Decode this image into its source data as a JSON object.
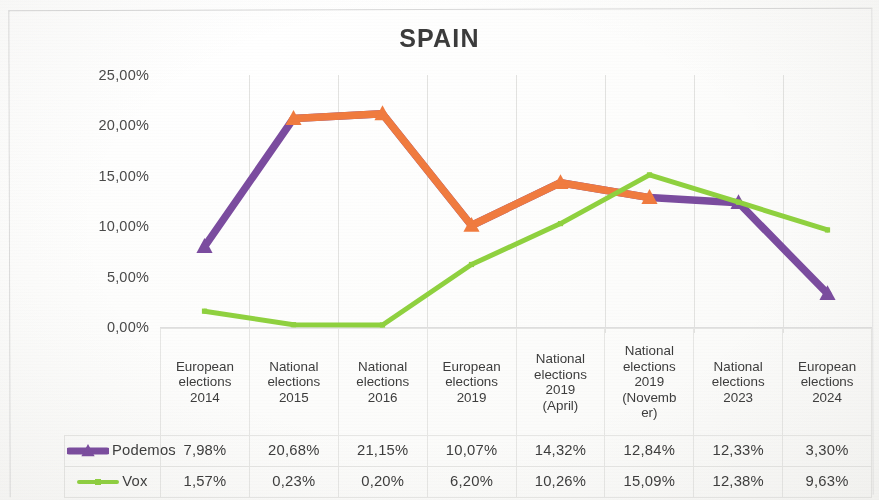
{
  "chart_data": {
    "type": "line",
    "title": "SPAIN",
    "xlabel": "",
    "ylabel": "",
    "ylim": [
      0,
      25
    ],
    "ytick_values": [
      0,
      5,
      10,
      15,
      20,
      25
    ],
    "ytick_labels": [
      "0,00%",
      "5,00%",
      "10,00%",
      "15,00%",
      "20,00%",
      "25,00%"
    ],
    "grid": "vertical",
    "legend_position": "table-left",
    "categories": [
      "European elections 2014",
      "National elections 2015",
      "National elections 2016",
      "European elections 2019",
      "National elections 2019 (April)",
      "National elections 2019 (Novemb er)",
      "National elections 2023",
      "European elections 2024"
    ],
    "category_lines": [
      [
        "European",
        "elections",
        "2014"
      ],
      [
        "National",
        "elections",
        "2015"
      ],
      [
        "National",
        "elections",
        "2016"
      ],
      [
        "European",
        "elections",
        "2019"
      ],
      [
        "National",
        "elections",
        "2019",
        "(April)"
      ],
      [
        "National",
        "elections",
        "2019",
        "(Novemb",
        "er)"
      ],
      [
        "National",
        "elections",
        "2023"
      ],
      [
        "European",
        "elections",
        "2024"
      ]
    ],
    "series": [
      {
        "name": "Podemos",
        "color": "#7B4C9F",
        "overlay_color": "#F07B3F",
        "marker": "triangle",
        "values": [
          7.98,
          20.68,
          21.15,
          10.07,
          14.32,
          12.84,
          12.33,
          3.3
        ],
        "labels": [
          "7,98%",
          "20,68%",
          "21,15%",
          "10,07%",
          "14,32%",
          "12,84%",
          "12,33%",
          "3,30%"
        ]
      },
      {
        "name": "Vox",
        "color": "#8FD13F",
        "overlay_color": "",
        "marker": "square",
        "values": [
          1.57,
          0.23,
          0.2,
          6.2,
          10.26,
          15.09,
          12.38,
          9.63
        ],
        "labels": [
          "1,57%",
          "0,23%",
          "0,20%",
          "6,20%",
          "10,26%",
          "15,09%",
          "12,38%",
          "9,63%"
        ]
      }
    ]
  },
  "colors": {
    "podemos": "#7B4C9F",
    "podemos_overlay": "#F07B3F",
    "vox": "#8FD13F",
    "title": "#3B3B3B",
    "gridline": "#E2E2E0",
    "tableborder": "#E6E6E4"
  }
}
